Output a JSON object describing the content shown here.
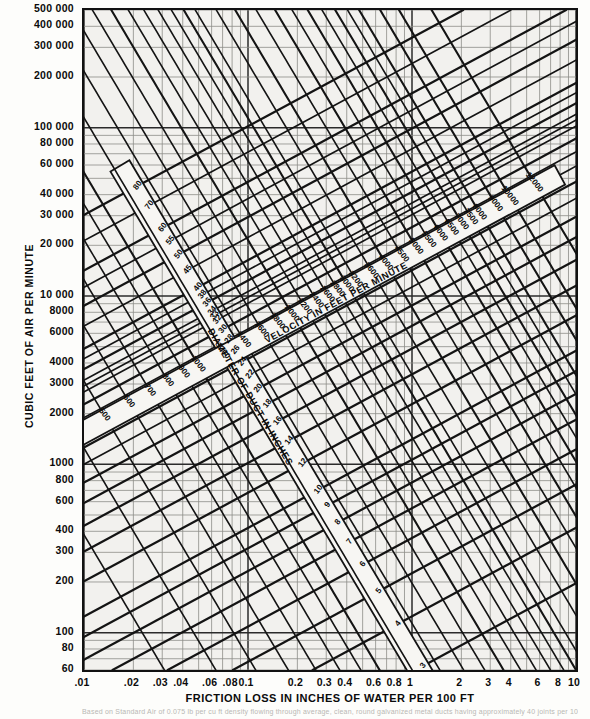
{
  "figure": {
    "xlabel": "FRICTION LOSS IN INCHES OF WATER PER 100 FT",
    "ylabel": "CUBIC FEET OF AIR PER MINUTE",
    "velocity_band_label": "VELOCITY IN FEET PER MINUTE",
    "diameter_band_label": "DIAMETER OF DUCT IN INCHES",
    "footnote": "Based on Standard Air of 0.075 lb per cu ft density flowing through average, clean, round galvanized metal ducts having approximately 40 joints per 100 ft"
  },
  "chart_data": {
    "type": "line",
    "xlabel": "FRICTION LOSS IN INCHES OF WATER PER 100 FT",
    "ylabel": "CUBIC FEET OF AIR PER MINUTE",
    "xscale": "log",
    "yscale": "log",
    "xlim": [
      0.01,
      10
    ],
    "ylim": [
      60,
      500000
    ],
    "grid": true,
    "legend": "none",
    "x_tick_labels": [
      ".01",
      ".02",
      ".03",
      ".04",
      ".06",
      ".08",
      "0.1",
      "0.2",
      "0.3",
      "0.4",
      "0.6",
      "0.8",
      "1",
      "2",
      "3",
      "4",
      "6",
      "8",
      "10"
    ],
    "x_tick_values": [
      0.01,
      0.02,
      0.03,
      0.04,
      0.06,
      0.08,
      0.1,
      0.2,
      0.3,
      0.4,
      0.6,
      0.8,
      1,
      2,
      3,
      4,
      6,
      8,
      10
    ],
    "y_tick_labels": [
      "60",
      "80",
      "100",
      "200",
      "300",
      "400",
      "600",
      "800",
      "1000",
      "2000",
      "3000",
      "4000",
      "6000",
      "8000",
      "10 000",
      "20 000",
      "30 000",
      "40 000",
      "60 000",
      "80 000",
      "100 000",
      "200 000",
      "300 000",
      "400 000",
      "500 000"
    ],
    "y_tick_values": [
      60,
      80,
      100,
      200,
      300,
      400,
      600,
      800,
      1000,
      2000,
      3000,
      4000,
      6000,
      8000,
      10000,
      20000,
      30000,
      40000,
      60000,
      80000,
      100000,
      200000,
      300000,
      400000,
      500000
    ],
    "series": [
      {
        "name": "DIAMETER OF DUCT IN INCHES",
        "units": "in",
        "direction": "up-right",
        "labels": [
          "3",
          "4",
          "5",
          "6",
          "7",
          "8",
          "9",
          "10",
          "12",
          "14",
          "16",
          "18",
          "20",
          "22",
          "24",
          "26",
          "28",
          "30",
          "32",
          "33",
          "34",
          "36",
          "38",
          "40",
          "45",
          "50",
          "55",
          "60",
          "70",
          "80"
        ],
        "values": [
          3,
          4,
          5,
          6,
          7,
          8,
          9,
          10,
          12,
          14,
          16,
          18,
          20,
          22,
          24,
          26,
          28,
          30,
          32,
          33,
          34,
          36,
          38,
          40,
          45,
          50,
          55,
          60,
          70,
          80
        ]
      },
      {
        "name": "VELOCITY IN FEET PER MINUTE",
        "units": "fpm",
        "direction": "down-right",
        "labels": [
          "300",
          "400",
          "500",
          "600",
          "700",
          "800",
          "900",
          "1000",
          "1200",
          "1400",
          "1600",
          "1800",
          "2000",
          "2200",
          "2400",
          "2600",
          "2800",
          "3000",
          "3200",
          "3600",
          "4000",
          "4500",
          "5000",
          "5500",
          "6000",
          "6500",
          "7000",
          "7500",
          "8000",
          "9000",
          "10000",
          "12000"
        ],
        "values": [
          300,
          400,
          500,
          600,
          700,
          800,
          900,
          1000,
          1200,
          1400,
          1600,
          1800,
          2000,
          2200,
          2400,
          2600,
          2800,
          3000,
          3200,
          3600,
          4000,
          4500,
          5000,
          5500,
          6000,
          6500,
          7000,
          7500,
          8000,
          9000,
          10000,
          12000
        ]
      }
    ]
  },
  "colors": {
    "ink": "#111111",
    "grid": "#8f8f8a",
    "paper": "#f2f1ee"
  }
}
